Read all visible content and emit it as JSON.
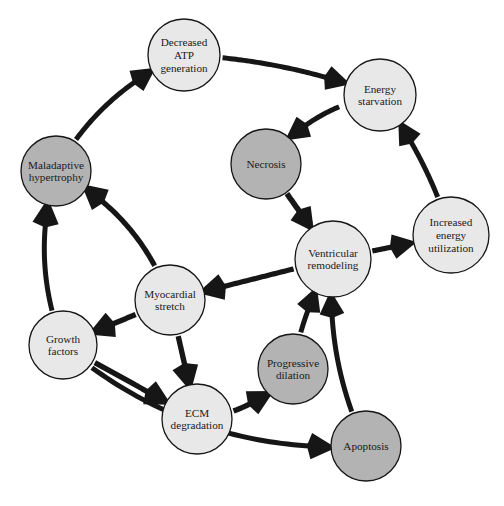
{
  "diagram": {
    "type": "directed-cycle-graph",
    "colors": {
      "node_fill_light": "#e8e8e8",
      "node_fill_shaded": "#b3b3b3",
      "stroke": "#161616",
      "background": "#ffffff",
      "text": "#1a1a1a"
    },
    "nodes": [
      {
        "id": "decreased_atp",
        "label": "Decreased ATP generation",
        "lines": [
          "Decreased",
          "ATP",
          "generation"
        ],
        "shade": "light",
        "cx": 184,
        "cy": 55,
        "r": 36
      },
      {
        "id": "energy_starvation",
        "label": "Energy starvation",
        "lines": [
          "Energy",
          "starvation"
        ],
        "shade": "light",
        "cx": 380,
        "cy": 95,
        "r": 36
      },
      {
        "id": "maladaptive_hypertrophy",
        "label": "Maladaptive hypertrophy",
        "lines": [
          "Maladaptive",
          "hypertrophy"
        ],
        "shade": "shaded",
        "cx": 56,
        "cy": 171,
        "r": 35
      },
      {
        "id": "necrosis",
        "label": "Necrosis",
        "lines": [
          "Necrosis"
        ],
        "shade": "shaded",
        "cx": 266,
        "cy": 164,
        "r": 35
      },
      {
        "id": "increased_energy_utilization",
        "label": "Increased energy utilization",
        "lines": [
          "Increased",
          "energy",
          "utilization"
        ],
        "shade": "light",
        "cx": 451,
        "cy": 235,
        "r": 38
      },
      {
        "id": "ventricular_remodeling",
        "label": "Ventricular remodeling",
        "lines": [
          "Ventricular",
          "remodeling"
        ],
        "shade": "light",
        "cx": 333,
        "cy": 259,
        "r": 38
      },
      {
        "id": "myocardial_stretch",
        "label": "Myocardial stretch",
        "lines": [
          "Myocardial",
          "stretch"
        ],
        "shade": "light",
        "cx": 170,
        "cy": 300,
        "r": 35
      },
      {
        "id": "growth_factors",
        "label": "Growth factors",
        "lines": [
          "Growth",
          "factors"
        ],
        "shade": "light",
        "cx": 63,
        "cy": 345,
        "r": 34
      },
      {
        "id": "progressive_dilation",
        "label": "Progressive dilation",
        "lines": [
          "Progressive",
          "dilation"
        ],
        "shade": "shaded",
        "cx": 293,
        "cy": 369,
        "r": 35
      },
      {
        "id": "ecm_degradation",
        "label": "ECM degradation",
        "lines": [
          "ECM",
          "degradation"
        ],
        "shade": "light",
        "cx": 197,
        "cy": 419,
        "r": 35
      },
      {
        "id": "apoptosis",
        "label": "Apoptosis",
        "lines": [
          "Apoptosis"
        ],
        "shade": "shaded",
        "cx": 366,
        "cy": 446,
        "r": 35
      }
    ],
    "edges": [
      {
        "id": "e1",
        "from": "maladaptive_hypertrophy",
        "to": "decreased_atp"
      },
      {
        "id": "e2",
        "from": "decreased_atp",
        "to": "energy_starvation"
      },
      {
        "id": "e3",
        "from": "energy_starvation",
        "to": "necrosis"
      },
      {
        "id": "e4",
        "from": "necrosis",
        "to": "ventricular_remodeling"
      },
      {
        "id": "e5",
        "from": "increased_energy_utilization",
        "to": "energy_starvation"
      },
      {
        "id": "e6",
        "from": "ventricular_remodeling",
        "to": "increased_energy_utilization"
      },
      {
        "id": "e7",
        "from": "ventricular_remodeling",
        "to": "myocardial_stretch"
      },
      {
        "id": "e8",
        "from": "myocardial_stretch",
        "to": "maladaptive_hypertrophy"
      },
      {
        "id": "e9",
        "from": "myocardial_stretch",
        "to": "growth_factors"
      },
      {
        "id": "e10",
        "from": "growth_factors",
        "to": "maladaptive_hypertrophy"
      },
      {
        "id": "e11",
        "from": "myocardial_stretch",
        "to": "ecm_degradation"
      },
      {
        "id": "e12",
        "from": "growth_factors",
        "to": "ecm_degradation"
      },
      {
        "id": "e13",
        "from": "ecm_degradation",
        "to": "progressive_dilation"
      },
      {
        "id": "e14",
        "from": "progressive_dilation",
        "to": "ventricular_remodeling"
      },
      {
        "id": "e15",
        "from": "growth_factors",
        "to": "apoptosis"
      },
      {
        "id": "e16",
        "from": "apoptosis",
        "to": "ventricular_remodeling"
      }
    ]
  }
}
